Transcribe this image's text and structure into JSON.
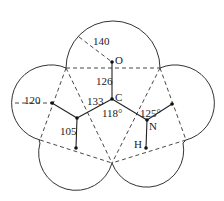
{
  "diagram": {
    "type": "molecular-van-der-waals-model",
    "atoms": [
      {
        "id": "O",
        "label": "O"
      },
      {
        "id": "C",
        "label": "C"
      },
      {
        "id": "N",
        "label": "N"
      },
      {
        "id": "H",
        "label": "H"
      }
    ],
    "bond_lengths": {
      "vdw_radius_O": "140",
      "C_O": "126",
      "C_C": "133",
      "vdw_radius_left": "120",
      "left_vertical": "105"
    },
    "bond_angles": {
      "at_C": "118°",
      "at_N": "125°"
    }
  }
}
